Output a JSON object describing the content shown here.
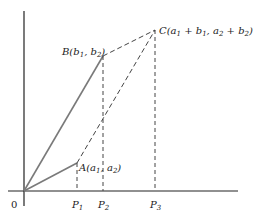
{
  "diagram": {
    "type": "vector-addition-parallelogram",
    "origin_label": "0",
    "points": {
      "A": {
        "label_main": "A(a",
        "sub1": "1",
        "mid": ", a",
        "sub2": "2",
        "end": ")"
      },
      "B": {
        "label_main": "B(b",
        "sub1": "1",
        "mid": ", b",
        "sub2": "2",
        "end": ")"
      },
      "C": {
        "label_main": "C(a",
        "sub1": "1",
        "p1": " + b",
        "sub2": "1",
        "mid": ", a",
        "sub3": "2",
        "p2": " + b",
        "sub4": "2",
        "end": ")"
      }
    },
    "axis_ticks": [
      {
        "label": "P",
        "sub": "1"
      },
      {
        "label": "P",
        "sub": "2"
      },
      {
        "label": "P",
        "sub": "3"
      }
    ],
    "colors": {
      "solid_line": "#7a7a7a",
      "dashed_line": "#444444",
      "axis": "#222222"
    }
  }
}
